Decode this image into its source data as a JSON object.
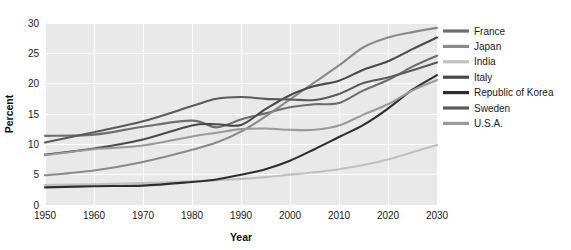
{
  "chart_data": {
    "type": "line",
    "title": "",
    "xlabel": "Year",
    "ylabel": "Percent",
    "xlim": [
      1950,
      2030
    ],
    "ylim": [
      0,
      30
    ],
    "xticks": [
      1950,
      1960,
      1970,
      1980,
      1990,
      2000,
      2010,
      2020,
      2030
    ],
    "yticks": [
      0,
      5,
      10,
      15,
      20,
      25,
      30
    ],
    "grid": true,
    "legend_position": "right",
    "x": [
      1950,
      1960,
      1970,
      1980,
      1985,
      1990,
      1995,
      2000,
      2005,
      2010,
      2015,
      2020,
      2025,
      2030
    ],
    "series": [
      {
        "name": "France",
        "color": "#6e6e6e",
        "values": [
          11.4,
          11.6,
          12.9,
          13.9,
          12.8,
          14.1,
          15.1,
          16.1,
          16.6,
          16.8,
          18.9,
          20.6,
          22.8,
          24.6
        ]
      },
      {
        "name": "Japan",
        "color": "#8a8a8a",
        "values": [
          4.9,
          5.7,
          7.1,
          9.1,
          10.3,
          12.1,
          14.6,
          17.4,
          20.2,
          23.0,
          26.0,
          27.6,
          28.5,
          29.2
        ]
      },
      {
        "name": "India",
        "color": "#c0c0c0",
        "values": [
          3.3,
          3.4,
          3.6,
          3.9,
          4.1,
          4.3,
          4.6,
          5.0,
          5.4,
          5.9,
          6.6,
          7.5,
          8.7,
          9.9
        ]
      },
      {
        "name": "Italy",
        "color": "#4a4a4a",
        "values": [
          8.3,
          9.3,
          10.8,
          13.1,
          13.3,
          13.2,
          15.8,
          18.1,
          19.6,
          20.5,
          22.3,
          23.7,
          25.7,
          27.6
        ]
      },
      {
        "name": "Republic of Korea",
        "color": "#2e2e2e",
        "values": [
          2.9,
          3.1,
          3.2,
          3.8,
          4.2,
          5.0,
          5.9,
          7.3,
          9.2,
          11.2,
          13.2,
          15.9,
          19.0,
          21.4
        ]
      },
      {
        "name": "Sweden",
        "color": "#5a5a5a",
        "values": [
          10.3,
          12.0,
          13.8,
          16.3,
          17.5,
          17.8,
          17.5,
          17.4,
          17.3,
          18.3,
          20.1,
          21.0,
          22.2,
          23.5
        ]
      },
      {
        "name": "U.S.A.",
        "color": "#9a9a9a",
        "values": [
          8.2,
          9.2,
          9.8,
          11.3,
          11.9,
          12.5,
          12.6,
          12.4,
          12.4,
          13.1,
          14.9,
          16.6,
          18.9,
          20.6
        ]
      }
    ]
  },
  "legend": {
    "items": [
      {
        "label": "France"
      },
      {
        "label": "Japan"
      },
      {
        "label": "India"
      },
      {
        "label": "Italy"
      },
      {
        "label": "Republic of Korea"
      },
      {
        "label": "Sweden"
      },
      {
        "label": "U.S.A."
      }
    ]
  }
}
